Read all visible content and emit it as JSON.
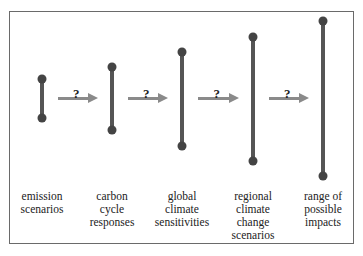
{
  "diagram": {
    "title": "",
    "stages": [
      {
        "label": "emission scenarios",
        "lines": [
          "emission",
          "scenarios"
        ],
        "x": 42,
        "top": 79,
        "bottom": 118
      },
      {
        "label": "carbon cycle responses",
        "lines": [
          "carbon",
          "cycle",
          "responses"
        ],
        "x": 112,
        "top": 67,
        "bottom": 130
      },
      {
        "label": "global climate sensitivities",
        "lines": [
          "global",
          "climate",
          "sensitivities"
        ],
        "x": 182,
        "top": 52,
        "bottom": 146
      },
      {
        "label": "regional climate change scenarios",
        "lines": [
          "regional",
          "climate",
          "change",
          "scenarios"
        ],
        "x": 253,
        "top": 37,
        "bottom": 161
      },
      {
        "label": "range of possible impacts",
        "lines": [
          "range of",
          "possible",
          "impacts"
        ],
        "x": 323,
        "top": 21,
        "bottom": 176
      }
    ],
    "arrows": [
      {
        "from": 0,
        "to": 1,
        "label": "?"
      },
      {
        "from": 1,
        "to": 2,
        "label": "?"
      },
      {
        "from": 2,
        "to": 3,
        "label": "?"
      },
      {
        "from": 3,
        "to": 4,
        "label": "?"
      }
    ],
    "colors": {
      "bar": "#555555",
      "dot": "#444444",
      "arrow": "#8a8a8a",
      "frame": "#6a6a6a"
    }
  }
}
